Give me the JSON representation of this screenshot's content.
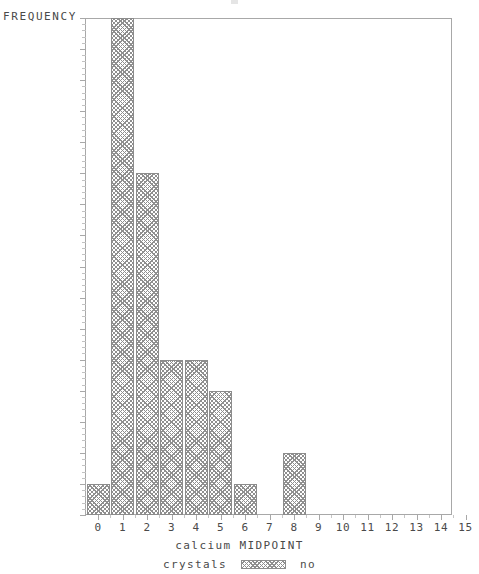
{
  "chart_data": {
    "type": "bar",
    "title": "",
    "xlabel": "calcium MIDPOINT",
    "ylabel": "FREQUENCY",
    "categories": [
      "0",
      "1",
      "2",
      "3",
      "4",
      "5",
      "6",
      "7",
      "8",
      "9",
      "10",
      "11",
      "12",
      "13",
      "14",
      "15"
    ],
    "values": [
      1,
      16,
      11,
      5,
      5,
      4,
      1,
      0,
      2,
      0,
      0,
      0,
      0,
      0,
      0,
      0
    ],
    "xlim": [
      -0.5,
      15.5
    ],
    "ylim": [
      0,
      16
    ],
    "xticks": [
      "0",
      "1",
      "2",
      "3",
      "4",
      "5",
      "6",
      "7",
      "8",
      "9",
      "10",
      "11",
      "12",
      "13",
      "14",
      "15"
    ],
    "yticks": [
      "0",
      "1",
      "2",
      "3",
      "4",
      "5",
      "6",
      "7",
      "8",
      "9",
      "10",
      "11",
      "12",
      "13",
      "14",
      "15",
      "16"
    ],
    "grid": false,
    "legend_position": "bottom-center",
    "legend": [
      {
        "title": "crystals",
        "label": "no",
        "pattern": "crosshatch"
      }
    ],
    "bar_fill": "#ffffff",
    "bar_hatch_color": "#8f8f8f",
    "bar_edge_color": "#8c8c8c",
    "axis_color": "#a8a8a8",
    "text_color": "#4a4a4a",
    "background": "#ffffff"
  }
}
